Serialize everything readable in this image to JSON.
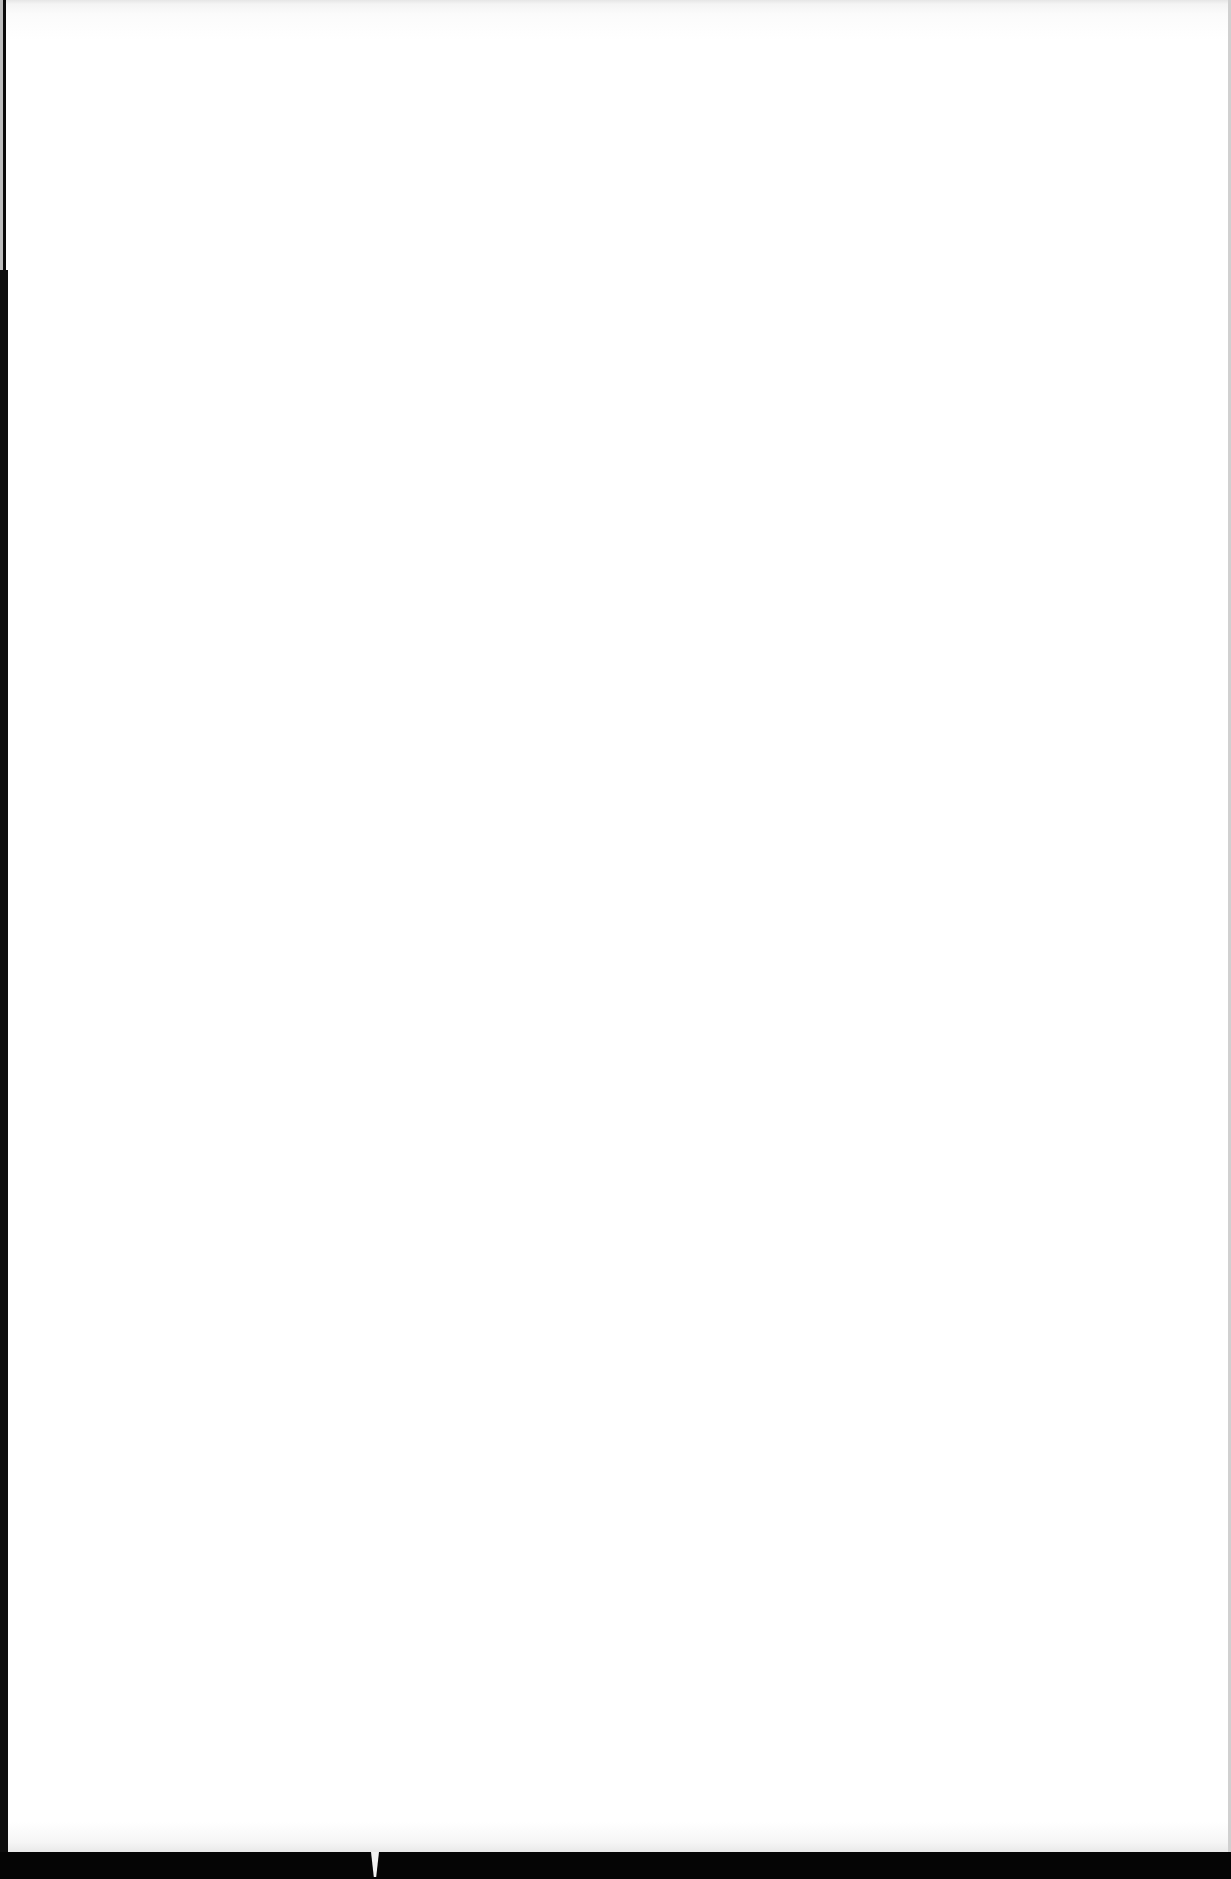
{
  "document": {
    "type": "scanned-page",
    "content": "blank",
    "text_blocks": []
  },
  "colors": {
    "page": "#ffffff",
    "scan_border": "#0a0a0a",
    "edge_shadow": "#0d0d0d"
  }
}
